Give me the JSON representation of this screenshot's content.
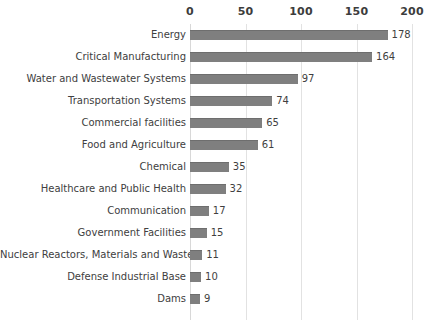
{
  "chart_data": {
    "type": "bar",
    "orientation": "horizontal",
    "title": "",
    "subtitle": "",
    "xlabel": "",
    "ylabel": "",
    "xlim": [
      0,
      200
    ],
    "ylim": null,
    "grid": true,
    "legend": false,
    "legend_position": "none",
    "xticks": [
      "0",
      "50",
      "100",
      "150",
      "200"
    ],
    "xtick_values": [
      0,
      50,
      100,
      150,
      200
    ],
    "categories": [
      "Energy",
      "Critical Manufacturing",
      "Water and Wastewater Systems",
      "Transportation Systems",
      "Commercial facilities",
      "Food and Agriculture",
      "Chemical",
      "Healthcare and Public Health",
      "Communication",
      "Government Facilities",
      "Nuclear Reactors, Materials and Waste",
      "Defense Industrial Base",
      "Dams"
    ],
    "values": [
      178,
      164,
      97,
      74,
      65,
      61,
      35,
      32,
      17,
      15,
      11,
      10,
      9
    ],
    "value_labels": [
      "178",
      "164",
      "97",
      "74",
      "65",
      "61",
      "35",
      "32",
      "17",
      "15",
      "11",
      "10",
      "9"
    ],
    "colors": {
      "bar": "#7f7f7f",
      "bar_top_edge": "#6e6e6e",
      "gridline": "#e2e2e2",
      "axis": "#d8d8d8",
      "tick_label": "#3c3c3c",
      "category_label": "#404040",
      "value_label": "#3f3f3f",
      "background": "#ffffff"
    }
  }
}
